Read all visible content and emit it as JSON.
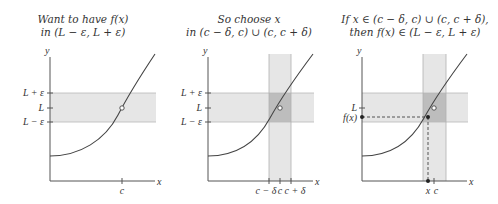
{
  "panels": [
    {
      "title_line1": "Want to have f(x)",
      "title_line2": "in (L − ε, L + ε)",
      "y_axis_label": "y",
      "x_axis_label": "x",
      "y_ticks": [
        "L + ε",
        "L",
        "L − ε"
      ],
      "x_ticks": [
        "c"
      ]
    },
    {
      "title_line1": "So choose x",
      "title_line2": "in (c − δ, c) ∪ (c, c + δ)",
      "y_axis_label": "y",
      "x_axis_label": "x",
      "y_ticks": [
        "L + ε",
        "L",
        "L − ε"
      ],
      "x_ticks": [
        "c − δ",
        "c",
        "c + δ"
      ]
    },
    {
      "title_line1": "If x ∈ (c − δ, c) ∪ (c, c + δ),",
      "title_line2": "then f(x) ∈ (L − ε, L + ε)",
      "y_axis_label": "y",
      "x_axis_label": "x",
      "y_ticks": [
        "L",
        "f(x)"
      ],
      "x_ticks": [
        "x",
        "c"
      ]
    }
  ],
  "colors": {
    "axis": "#555555",
    "curve": "#444444",
    "band_light": "#e6e6e6",
    "band_overlap": "#bdbdbd",
    "band_edge": "#b0b0b0"
  }
}
